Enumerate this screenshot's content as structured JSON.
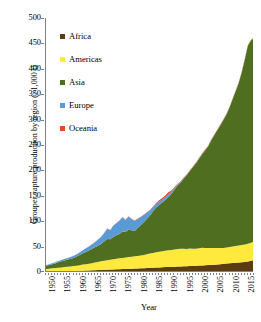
{
  "chart_data": {
    "type": "area",
    "title": "",
    "xlabel": "Year",
    "ylabel": "Grouper capture production by region (×1,000 t)",
    "stacked": true,
    "grid": false,
    "legend_position": "inside-top-left",
    "xlim": [
      1950,
      2018
    ],
    "ylim": [
      0,
      500
    ],
    "ytick_step": 50,
    "xtick_step": 5,
    "ytick_labels": [
      "500",
      "450",
      "400",
      "350",
      "300",
      "250",
      "200",
      "150",
      "100",
      "50",
      "0"
    ],
    "ytick_values": [
      500,
      450,
      400,
      350,
      300,
      250,
      200,
      150,
      100,
      50,
      0
    ],
    "xtick_labels": [
      "1950",
      "1955",
      "1960",
      "1965",
      "1970",
      "1975",
      "1980",
      "1985",
      "1990",
      "1995",
      "2000",
      "2005",
      "2010",
      "2015"
    ],
    "xtick_values": [
      1950,
      1955,
      1960,
      1965,
      1970,
      1975,
      1980,
      1985,
      1990,
      1995,
      2000,
      2005,
      2010,
      2015
    ],
    "x": [
      1950,
      1951,
      1952,
      1953,
      1954,
      1955,
      1956,
      1957,
      1958,
      1959,
      1960,
      1961,
      1962,
      1963,
      1964,
      1965,
      1966,
      1967,
      1968,
      1969,
      1970,
      1971,
      1972,
      1973,
      1974,
      1975,
      1976,
      1977,
      1978,
      1979,
      1980,
      1981,
      1982,
      1983,
      1984,
      1985,
      1986,
      1987,
      1988,
      1989,
      1990,
      1991,
      1992,
      1993,
      1994,
      1995,
      1996,
      1997,
      1998,
      1999,
      2000,
      2001,
      2002,
      2003,
      2004,
      2005,
      2006,
      2007,
      2008,
      2009,
      2010,
      2011,
      2012,
      2013,
      2014,
      2015,
      2016,
      2017,
      2018
    ],
    "series": [
      {
        "name": "Africa",
        "color": "#5E3C11",
        "values": [
          1.0,
          1.1,
          1.2,
          1.3,
          1.4,
          1.5,
          1.6,
          1.8,
          2.0,
          2.1,
          2.3,
          2.5,
          2.7,
          2.9,
          3.1,
          3.3,
          3.6,
          3.8,
          4.0,
          4.2,
          4.5,
          4.8,
          5.0,
          5.2,
          5.5,
          5.8,
          6.0,
          6.3,
          6.5,
          6.8,
          7.0,
          7.3,
          7.6,
          7.9,
          8.2,
          8.5,
          8.8,
          9.0,
          9.3,
          9.6,
          9.8,
          10.0,
          10.3,
          10.6,
          11.0,
          11.2,
          11.5,
          11.8,
          12.0,
          12.3,
          12.6,
          13.0,
          13.3,
          13.6,
          14.0,
          14.5,
          15.0,
          15.5,
          16.0,
          16.5,
          17.0,
          17.5,
          18.0,
          18.5,
          19.0,
          19.5,
          20.5,
          22.0,
          24.0
        ]
      },
      {
        "name": "Americas",
        "color": "#FFE93C",
        "values": [
          5.0,
          5.5,
          6.0,
          6.5,
          7.0,
          7.5,
          8.0,
          8.5,
          9.0,
          9.5,
          10.0,
          11.0,
          12.0,
          12.5,
          13.0,
          14.0,
          15.0,
          16.0,
          17.0,
          18.0,
          18.5,
          19.5,
          20.0,
          21.0,
          21.5,
          22.0,
          22.5,
          23.0,
          23.5,
          24.0,
          24.5,
          25.0,
          26.0,
          27.0,
          28.0,
          29.0,
          30.0,
          31.0,
          31.5,
          32.0,
          33.0,
          33.5,
          34.0,
          34.5,
          35.0,
          34.5,
          34.0,
          34.5,
          34.0,
          33.5,
          34.0,
          34.5,
          34.0,
          33.5,
          33.0,
          32.5,
          32.0,
          31.5,
          31.0,
          31.5,
          32.0,
          32.5,
          33.0,
          33.5,
          34.0,
          34.5,
          35.0,
          35.5,
          36.0
        ]
      },
      {
        "name": "Asia",
        "color": "#4F6E20",
        "values": [
          6.0,
          7.0,
          8.0,
          9.0,
          11.0,
          12.0,
          13.0,
          14.0,
          15.0,
          16.0,
          18.0,
          20.0,
          22.0,
          24.0,
          26.0,
          28.0,
          30.0,
          32.0,
          34.0,
          38.0,
          42.0,
          40.0,
          44.0,
          46.0,
          48.0,
          52.0,
          50.0,
          54.0,
          52.0,
          50.0,
          55.0,
          60.0,
          65.0,
          70.0,
          75.0,
          82.0,
          88.0,
          92.0,
          96.0,
          100.0,
          105.0,
          110.0,
          118.0,
          125.0,
          130.0,
          138.0,
          145.0,
          152.0,
          160.0,
          168.0,
          176.0,
          184.0,
          192.0,
          200.0,
          212.0,
          222.0,
          232.0,
          242.0,
          252.0,
          262.0,
          275.0,
          290.0,
          305.0,
          320.0,
          340.0,
          365.0,
          390.0,
          398.0,
          400.0
        ]
      },
      {
        "name": "Europe",
        "color": "#5B9BD5",
        "values": [
          1.5,
          1.6,
          1.8,
          2.0,
          2.2,
          2.5,
          2.8,
          3.0,
          3.5,
          4.0,
          4.5,
          5.0,
          6.0,
          7.0,
          8.0,
          9.0,
          10.0,
          12.0,
          14.0,
          16.0,
          20.0,
          18.0,
          22.0,
          24.0,
          26.0,
          28.0,
          24.0,
          26.0,
          22.0,
          20.0,
          18.0,
          16.0,
          14.0,
          12.0,
          10.0,
          8.0,
          7.0,
          6.5,
          6.0,
          5.5,
          5.0,
          4.0,
          3.0,
          2.0,
          1.5,
          1.2,
          1.0,
          0.9,
          0.8,
          0.8,
          0.7,
          0.7,
          0.6,
          0.6,
          0.6,
          0.5,
          0.5,
          0.5,
          0.5,
          0.5,
          0.5,
          0.5,
          0.5,
          0.5,
          0.5,
          0.5,
          0.5,
          0.5,
          0.5
        ]
      },
      {
        "name": "Oceania",
        "color": "#E8472A",
        "values": [
          0.2,
          0.2,
          0.2,
          0.2,
          0.2,
          0.2,
          0.2,
          0.2,
          0.2,
          0.2,
          0.3,
          0.3,
          0.3,
          0.3,
          0.3,
          0.3,
          0.3,
          0.4,
          0.4,
          0.4,
          0.4,
          0.4,
          0.5,
          0.5,
          0.5,
          0.5,
          0.5,
          0.5,
          0.6,
          0.6,
          0.6,
          0.6,
          0.7,
          0.8,
          1.0,
          1.5,
          2.0,
          2.5,
          3.0,
          3.5,
          4.0,
          3.0,
          2.0,
          1.5,
          1.2,
          1.0,
          1.0,
          1.0,
          1.0,
          1.0,
          1.0,
          1.0,
          1.0,
          1.0,
          1.0,
          1.0,
          1.0,
          1.0,
          1.0,
          1.0,
          1.0,
          1.0,
          1.0,
          1.0,
          1.0,
          1.0,
          1.0,
          1.0,
          1.0
        ]
      }
    ]
  },
  "legend": {
    "items": [
      {
        "label": "Africa",
        "color": "#5E3C11"
      },
      {
        "label": "Americas",
        "color": "#FFE93C"
      },
      {
        "label": "Asia",
        "color": "#4F6E20"
      },
      {
        "label": "Europe",
        "color": "#5B9BD5"
      },
      {
        "label": "Oceania",
        "color": "#E8472A"
      }
    ]
  },
  "axes": {
    "x_title": "Year",
    "y_title": "Grouper capture production by region (×1,000 t)"
  }
}
